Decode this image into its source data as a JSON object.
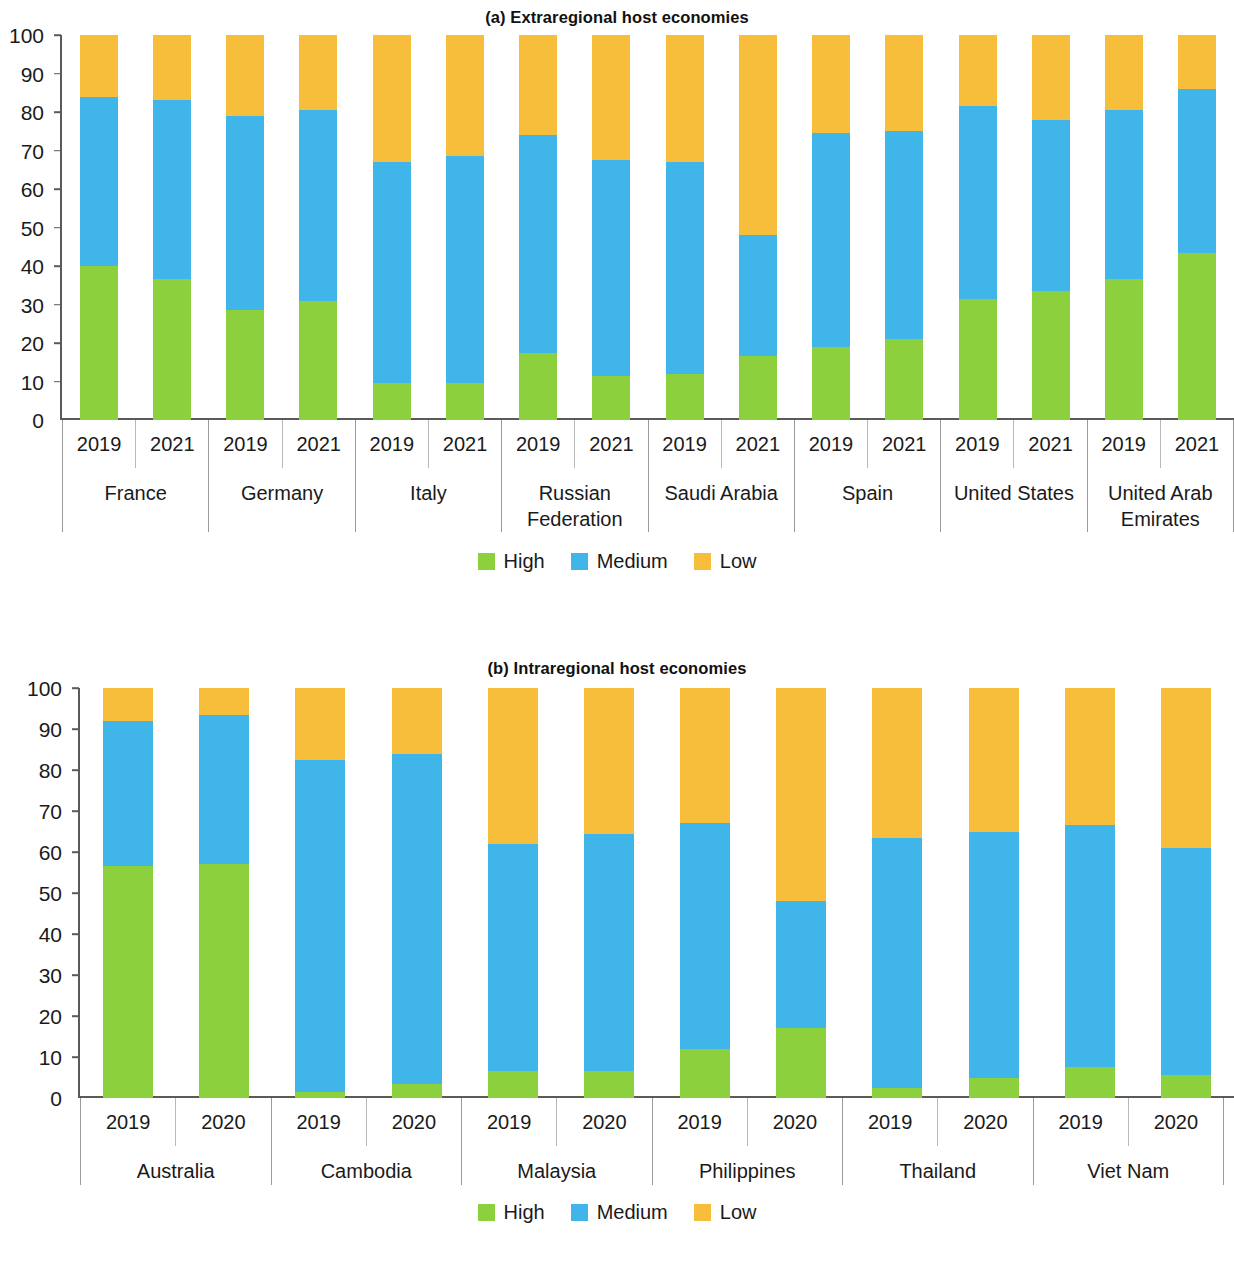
{
  "colors": {
    "high": "#8dd03e",
    "medium": "#3fb5ea",
    "low": "#f7be3c"
  },
  "panel_a": {
    "title": "(a) Extraregional host economies",
    "legend": [
      {
        "label": "High",
        "key": "high"
      },
      {
        "label": "Medium",
        "key": "medium"
      },
      {
        "label": "Low",
        "key": "low"
      }
    ],
    "y_ticks": [
      "100",
      "90",
      "80",
      "70",
      "60",
      "50",
      "40",
      "30",
      "20",
      "10",
      "0"
    ]
  },
  "panel_b": {
    "title": "(b) Intraregional host economies",
    "legend": [
      {
        "label": "High",
        "key": "high"
      },
      {
        "label": "Medium",
        "key": "medium"
      },
      {
        "label": "Low",
        "key": "low"
      }
    ],
    "y_ticks": [
      "100",
      "90",
      "80",
      "70",
      "60",
      "50",
      "40",
      "30",
      "20",
      "10",
      "0"
    ]
  },
  "chart_data": [
    {
      "type": "bar",
      "stacked": true,
      "title": "(a) Extraregional host economies",
      "xlabel": "",
      "ylabel": "",
      "ylim": [
        0,
        100
      ],
      "yticks": [
        0,
        10,
        20,
        30,
        40,
        50,
        60,
        70,
        80,
        90,
        100
      ],
      "grid": false,
      "legend_position": "bottom-center",
      "legend": [
        "High",
        "Medium",
        "Low"
      ],
      "groups": [
        {
          "name": "France",
          "years": [
            "2019",
            "2021"
          ]
        },
        {
          "name": "Germany",
          "years": [
            "2019",
            "2021"
          ]
        },
        {
          "name": "Italy",
          "years": [
            "2019",
            "2021"
          ]
        },
        {
          "name": "Russian Federation",
          "years": [
            "2019",
            "2021"
          ]
        },
        {
          "name": "Saudi Arabia",
          "years": [
            "2019",
            "2021"
          ]
        },
        {
          "name": "Spain",
          "years": [
            "2019",
            "2021"
          ]
        },
        {
          "name": "United States",
          "years": [
            "2019",
            "2021"
          ]
        },
        {
          "name": "United Arab Emirates",
          "years": [
            "2019",
            "2021"
          ]
        }
      ],
      "categories": [
        "France 2019",
        "France 2021",
        "Germany 2019",
        "Germany 2021",
        "Italy 2019",
        "Italy 2021",
        "Russian Federation 2019",
        "Russian Federation 2021",
        "Saudi Arabia 2019",
        "Saudi Arabia 2021",
        "Spain 2019",
        "Spain 2021",
        "United States 2019",
        "United States 2021",
        "United Arab Emirates 2019",
        "United Arab Emirates 2021"
      ],
      "series": [
        {
          "name": "High",
          "values": [
            40.0,
            36.5,
            28.5,
            31.0,
            9.5,
            9.5,
            17.5,
            11.5,
            12.0,
            16.5,
            19.0,
            21.0,
            31.5,
            33.5,
            36.5,
            43.5
          ]
        },
        {
          "name": "Medium",
          "values": [
            44.0,
            46.5,
            50.5,
            49.5,
            57.5,
            59.0,
            56.5,
            56.0,
            55.0,
            31.5,
            55.5,
            54.0,
            50.0,
            44.5,
            44.0,
            42.5
          ]
        },
        {
          "name": "Low",
          "values": [
            16.0,
            17.0,
            21.0,
            19.5,
            33.0,
            31.5,
            26.0,
            32.5,
            33.0,
            52.0,
            25.5,
            25.0,
            18.5,
            22.0,
            19.5,
            14.0
          ]
        }
      ],
      "cumulative_tops": {
        "high": [
          40.0,
          36.5,
          28.5,
          31.0,
          9.5,
          9.5,
          17.5,
          11.5,
          12.0,
          16.5,
          19.0,
          21.0,
          31.5,
          33.5,
          36.5,
          43.5
        ],
        "medium": [
          84.0,
          83.0,
          79.0,
          80.5,
          67.0,
          68.5,
          74.0,
          67.5,
          67.0,
          48.0,
          74.5,
          75.0,
          81.5,
          78.0,
          80.5,
          86.0
        ],
        "low": [
          100,
          100,
          100,
          100,
          100,
          100,
          100,
          100,
          100,
          100,
          100,
          100,
          100,
          100,
          100,
          100
        ]
      }
    },
    {
      "type": "bar",
      "stacked": true,
      "title": "(b) Intraregional host economies",
      "xlabel": "",
      "ylabel": "",
      "ylim": [
        0,
        100
      ],
      "yticks": [
        0,
        10,
        20,
        30,
        40,
        50,
        60,
        70,
        80,
        90,
        100
      ],
      "grid": false,
      "legend_position": "bottom-center",
      "legend": [
        "High",
        "Medium",
        "Low"
      ],
      "groups": [
        {
          "name": "Australia",
          "years": [
            "2019",
            "2020"
          ]
        },
        {
          "name": "Cambodia",
          "years": [
            "2019",
            "2020"
          ]
        },
        {
          "name": "Malaysia",
          "years": [
            "2019",
            "2020"
          ]
        },
        {
          "name": "Philippines",
          "years": [
            "2019",
            "2020"
          ]
        },
        {
          "name": "Thailand",
          "years": [
            "2019",
            "2020"
          ]
        },
        {
          "name": "Viet Nam",
          "years": [
            "2019",
            "2020"
          ]
        }
      ],
      "categories": [
        "Australia 2019",
        "Australia 2020",
        "Cambodia 2019",
        "Cambodia 2020",
        "Malaysia 2019",
        "Malaysia 2020",
        "Philippines 2019",
        "Philippines 2020",
        "Thailand 2019",
        "Thailand 2020",
        "Viet Nam 2019",
        "Viet Nam 2020"
      ],
      "series": [
        {
          "name": "High",
          "values": [
            56.5,
            57.0,
            1.5,
            3.5,
            6.5,
            6.5,
            12.0,
            17.0,
            2.5,
            5.0,
            7.5,
            5.5
          ]
        },
        {
          "name": "Medium",
          "values": [
            35.5,
            36.5,
            81.0,
            80.5,
            55.5,
            58.0,
            55.0,
            31.0,
            61.0,
            60.0,
            59.0,
            55.5
          ]
        },
        {
          "name": "Low",
          "values": [
            8.0,
            6.5,
            17.5,
            16.0,
            38.0,
            35.5,
            33.0,
            52.0,
            36.5,
            35.0,
            33.5,
            39.0
          ]
        }
      ],
      "cumulative_tops": {
        "high": [
          56.5,
          57.0,
          1.5,
          3.5,
          6.5,
          6.5,
          12.0,
          17.0,
          2.5,
          5.0,
          7.5,
          5.5
        ],
        "medium": [
          92.0,
          93.5,
          82.5,
          84.0,
          62.0,
          64.5,
          67.0,
          48.0,
          63.5,
          65.0,
          66.5,
          61.0
        ],
        "low": [
          100,
          100,
          100,
          100,
          100,
          100,
          100,
          100,
          100,
          100,
          100,
          100
        ]
      }
    }
  ]
}
